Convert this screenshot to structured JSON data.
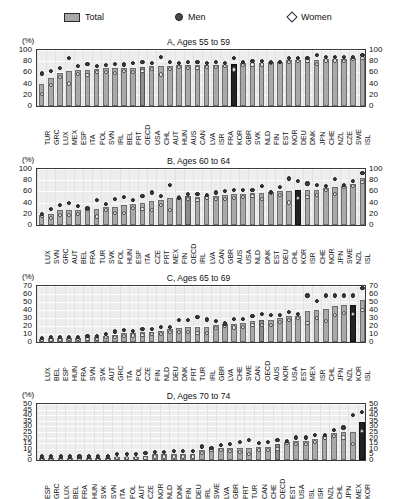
{
  "legend": {
    "total_label": "Total",
    "men_label": "Men",
    "women_label": "Women"
  },
  "axis_unit_label": "(%)",
  "chart_data": [
    {
      "type": "bar",
      "panel": "A",
      "title": "A, Ages 55 to 59",
      "ylabel": "(%)",
      "xlabel": "",
      "ylim": [
        0,
        100
      ],
      "yticks": [
        0,
        20,
        40,
        60,
        80,
        100
      ],
      "grid": true,
      "legend_position": "top",
      "highlight": [
        "OECD",
        "KOR"
      ],
      "categories": [
        "TUR",
        "GRC",
        "LUX",
        "MEX",
        "ESP",
        "ITA",
        "POL",
        "SVN",
        "IRL",
        "BEL",
        "PRT",
        "OECD",
        "USA",
        "CHL",
        "AUT",
        "HUN",
        "AUS",
        "CAN",
        "LVA",
        "ISR",
        "FRA",
        "KOR",
        "GBR",
        "SVK",
        "NLD",
        "FIN",
        "EST",
        "NOR",
        "DEU",
        "DNK",
        "JPN",
        "CHE",
        "NZL",
        "CZE",
        "SWE",
        "ISL"
      ],
      "series": [
        {
          "name": "Total",
          "values": [
            40,
            50,
            59,
            62,
            64,
            65,
            66,
            67,
            67,
            68,
            68,
            70,
            71,
            71,
            72,
            73,
            73,
            73,
            73,
            74,
            74,
            75,
            76,
            77,
            77,
            78,
            79,
            82,
            83,
            83,
            83,
            84,
            84,
            84,
            86,
            88
          ]
        },
        {
          "name": "Men",
          "values": [
            58,
            63,
            67,
            85,
            71,
            75,
            71,
            73,
            75,
            74,
            76,
            79,
            76,
            87,
            78,
            77,
            78,
            78,
            77,
            79,
            77,
            85,
            79,
            80,
            80,
            79,
            79,
            85,
            86,
            85,
            91,
            87,
            88,
            88,
            88,
            91
          ]
        },
        {
          "name": "Women",
          "values": [
            22,
            37,
            51,
            40,
            57,
            55,
            61,
            61,
            59,
            62,
            61,
            62,
            66,
            56,
            66,
            69,
            68,
            68,
            70,
            69,
            71,
            65,
            73,
            74,
            74,
            77,
            79,
            79,
            80,
            81,
            75,
            81,
            81,
            80,
            84,
            85
          ]
        }
      ]
    },
    {
      "type": "bar",
      "panel": "B",
      "title": "B, Ages 60 to 64",
      "ylabel": "(%)",
      "xlabel": "",
      "ylim": [
        0,
        100
      ],
      "yticks": [
        0,
        20,
        40,
        60,
        80,
        100
      ],
      "grid": true,
      "legend_position": "top",
      "highlight": [
        "OECD",
        "KOR"
      ],
      "categories": [
        "LUX",
        "SVN",
        "GRC",
        "AUT",
        "BEL",
        "FRA",
        "TUR",
        "SVK",
        "POL",
        "HUN",
        "ESP",
        "ITA",
        "CZE",
        "PRT",
        "MEX",
        "FIN",
        "OECD",
        "IRL",
        "LVA",
        "CAN",
        "GBR",
        "AUS",
        "USA",
        "NLD",
        "DNK",
        "EST",
        "DEU",
        "CHL",
        "KOR",
        "ISR",
        "CHE",
        "NOR",
        "JPN",
        "SWE",
        "NZL",
        "ISL"
      ],
      "series": [
        {
          "name": "Total",
          "values": [
            18,
            19,
            26,
            27,
            27,
            29,
            29,
            32,
            33,
            35,
            38,
            40,
            43,
            44,
            48,
            49,
            51,
            50,
            51,
            52,
            53,
            55,
            56,
            57,
            57,
            59,
            60,
            61,
            62,
            62,
            63,
            66,
            68,
            70,
            74,
            84
          ]
        },
        {
          "name": "Men",
          "values": [
            20,
            29,
            36,
            39,
            34,
            30,
            44,
            38,
            47,
            50,
            45,
            51,
            58,
            52,
            71,
            48,
            55,
            55,
            53,
            58,
            60,
            62,
            62,
            62,
            69,
            59,
            67,
            83,
            79,
            74,
            72,
            70,
            82,
            72,
            79,
            92
          ]
        },
        {
          "name": "Women",
          "values": [
            16,
            12,
            17,
            17,
            20,
            28,
            15,
            26,
            21,
            22,
            30,
            29,
            27,
            36,
            26,
            49,
            46,
            44,
            49,
            47,
            47,
            48,
            50,
            51,
            46,
            58,
            53,
            40,
            48,
            50,
            54,
            62,
            55,
            68,
            69,
            77
          ]
        }
      ]
    },
    {
      "type": "bar",
      "panel": "C",
      "title": "C, Ages 65 to 69",
      "ylabel": "(%)",
      "xlabel": "",
      "ylim": [
        0,
        70
      ],
      "yticks": [
        0,
        10,
        20,
        30,
        40,
        50,
        60,
        70
      ],
      "grid": true,
      "legend_position": "top",
      "highlight": [
        "OECD",
        "KOR"
      ],
      "categories": [
        "LUX",
        "BEL",
        "ESP",
        "HUN",
        "FRA",
        "SVN",
        "SVK",
        "AUT",
        "GRC",
        "ITA",
        "POL",
        "CZE",
        "FIN",
        "NLD",
        "DEU",
        "DNK",
        "PRT",
        "TUR",
        "IRL",
        "GBR",
        "LVA",
        "CHE",
        "SWE",
        "CAN",
        "OECD",
        "AUS",
        "NOR",
        "USA",
        "EST",
        "MEX",
        "ISR",
        "CHL",
        "JPN",
        "NZL",
        "KOR",
        "ISL"
      ],
      "series": [
        {
          "name": "Total",
          "values": [
            4,
            5,
            5,
            5,
            5,
            6,
            6,
            8,
            9,
            11,
            11,
            13,
            13,
            14,
            16,
            18,
            19,
            19,
            19,
            21,
            22,
            23,
            24,
            26,
            27,
            27,
            30,
            32,
            33,
            39,
            40,
            41,
            45,
            46,
            46,
            53
          ]
        },
        {
          "name": "Men",
          "values": [
            5,
            6,
            6,
            6,
            6,
            7,
            7,
            10,
            13,
            15,
            14,
            16,
            16,
            19,
            19,
            27,
            27,
            31,
            28,
            26,
            23,
            29,
            29,
            32,
            35,
            34,
            34,
            37,
            35,
            58,
            51,
            58,
            58,
            58,
            58,
            67
          ]
        },
        {
          "name": "Women",
          "values": [
            3,
            3,
            3,
            4,
            4,
            4,
            4,
            6,
            6,
            7,
            8,
            9,
            10,
            10,
            12,
            12,
            12,
            11,
            11,
            17,
            20,
            18,
            19,
            21,
            21,
            21,
            25,
            27,
            30,
            24,
            30,
            26,
            34,
            36,
            35,
            40
          ]
        }
      ]
    },
    {
      "type": "bar",
      "panel": "D",
      "title": "D, Ages 70 to 74",
      "ylabel": "(%)",
      "xlabel": "",
      "ylim": [
        0,
        50
      ],
      "yticks": [
        0,
        5,
        10,
        15,
        20,
        25,
        30,
        35,
        40,
        45,
        50
      ],
      "grid": true,
      "legend_position": "top",
      "highlight": [
        "OECD",
        "KOR"
      ],
      "categories": [
        "ESP",
        "GRC",
        "LUX",
        "BEL",
        "FRA",
        "HUN",
        "SVK",
        "SVN",
        "ITA",
        "POL",
        "AUT",
        "CZE",
        "NOR",
        "NLD",
        "DNK",
        "FIN",
        "DEU",
        "IRL",
        "SWE",
        "LVA",
        "GBR",
        "PRT",
        "TUR",
        "CAN",
        "CHE",
        "OECD",
        "EST",
        "USA",
        "ISL",
        "ISR",
        "NZL",
        "CHL",
        "JPN",
        "MEX",
        "KOR"
      ],
      "series": [
        {
          "name": "Total",
          "values": [
            2,
            2,
            2,
            2,
            2,
            2,
            2,
            2,
            3,
            3,
            3,
            4,
            5,
            5,
            5,
            5,
            5,
            9,
            10,
            11,
            11,
            11,
            11,
            12,
            12,
            14,
            16,
            17,
            17,
            19,
            21,
            24,
            25,
            25,
            34
          ]
        },
        {
          "name": "Men",
          "values": [
            3,
            3,
            3,
            3,
            3,
            3,
            3,
            3,
            5,
            5,
            5,
            6,
            7,
            7,
            8,
            8,
            8,
            12,
            11,
            13,
            14,
            16,
            18,
            15,
            16,
            18,
            17,
            20,
            20,
            22,
            22,
            27,
            29,
            40,
            43
          ]
        },
        {
          "name": "Women",
          "values": [
            1,
            1,
            1,
            1,
            1,
            1,
            1,
            1,
            2,
            2,
            2,
            2,
            3,
            3,
            3,
            3,
            3,
            6,
            9,
            9,
            8,
            7,
            5,
            9,
            9,
            10,
            15,
            14,
            14,
            16,
            20,
            21,
            20,
            14,
            26
          ]
        }
      ]
    }
  ]
}
